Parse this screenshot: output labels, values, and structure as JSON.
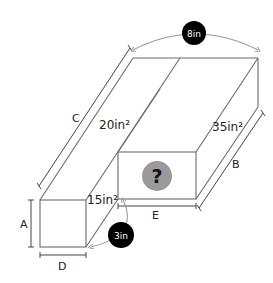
{
  "diagram": {
    "labels": {
      "A": "A",
      "B": "B",
      "C": "C",
      "D": "D",
      "E": "E"
    },
    "areas": {
      "top_left": "20in²",
      "top_right": "35in²",
      "front_small": "15in²",
      "front_unknown": "?"
    },
    "badges": {
      "top_width": "8in",
      "bottom_gap": "3in"
    },
    "colors": {
      "line": "#6b6b6b",
      "badge_bg": "#000000",
      "badge_text": "#ffffff",
      "question_bg": "#9a9a9a",
      "question_text": "#111111",
      "arc": "#9a9a9a"
    }
  }
}
